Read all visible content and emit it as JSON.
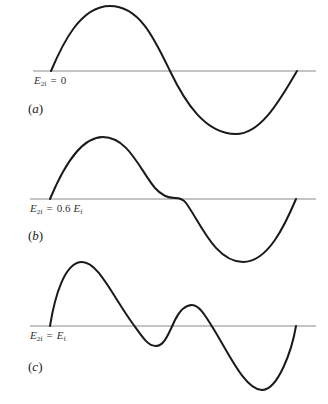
{
  "figure": {
    "panels": [
      {
        "id": "a",
        "label": "(a)",
        "label_letter": "a",
        "condition": {
          "lhs": "E",
          "lhs_sub": "2f",
          "eq": "=",
          "rhs": "0"
        },
        "description": "Pure sinusoid: single positive lobe followed by single negative lobe"
      },
      {
        "id": "b",
        "label": "(b)",
        "label_letter": "b",
        "condition": {
          "lhs": "E",
          "lhs_sub": "2f",
          "eq": "=",
          "rhs_coef": "0.6",
          "rhs": "E",
          "rhs_sub": "f"
        },
        "description": "Distorted wave with flattened inflection at the center zero crossing"
      },
      {
        "id": "c",
        "label": "(c)",
        "label_letter": "c",
        "condition": {
          "lhs": "E",
          "lhs_sub": "2f",
          "eq": "=",
          "rhs": "E",
          "rhs_sub": "f"
        },
        "description": "Strongly distorted wave with an extra dip and bump around the center"
      }
    ],
    "colors": {
      "curve": "#1a1a1a",
      "axis": "#8a8a8a",
      "text": "#333333"
    }
  }
}
